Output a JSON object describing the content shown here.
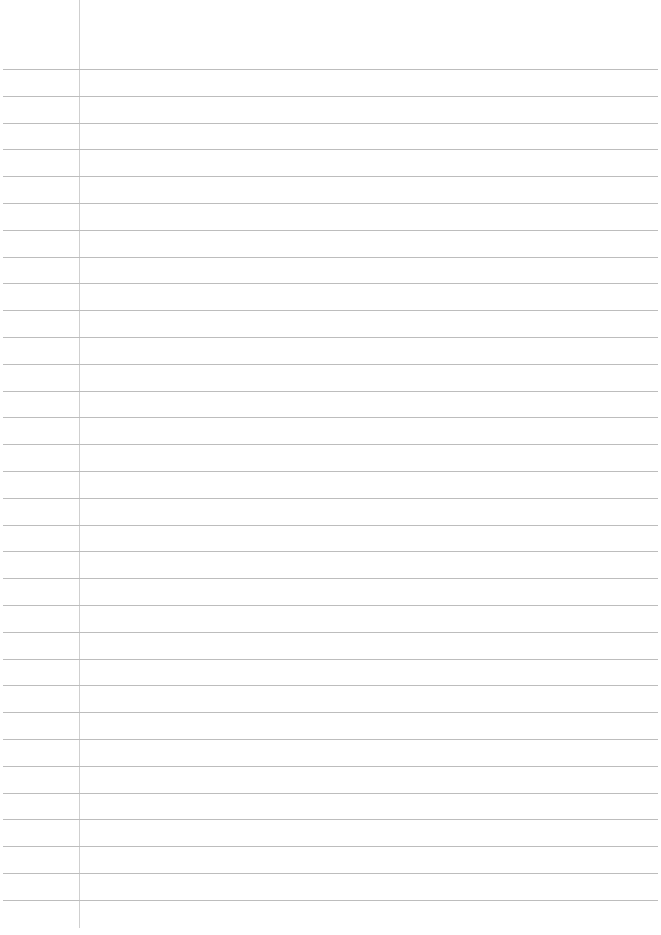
{
  "document": {
    "type": "lined-paper",
    "background_color": "#ffffff",
    "rule_color": "#bdbdbd",
    "margin_line_color": "#cfcfcf",
    "margin_line_x": 79,
    "first_rule_y": 69,
    "rule_spacing": 26.8,
    "rule_count": 32,
    "text": ""
  }
}
